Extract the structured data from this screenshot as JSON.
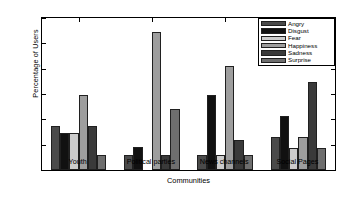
{
  "chart_data": {
    "type": "bar",
    "title": "",
    "xlabel": "Communities",
    "ylabel": "Percentage of Users",
    "categories": [
      "Youth",
      "Political parties",
      "News channels",
      "Social Pages"
    ],
    "ylim": [
      0,
      60
    ],
    "yticks": [
      0,
      10,
      20,
      30,
      40,
      50,
      60
    ],
    "grid": false,
    "legend_position": "upper right",
    "series": [
      {
        "name": "Angry",
        "color": "#4a4a4a",
        "values": [
          17.5,
          6.0,
          6.0,
          13.0
        ]
      },
      {
        "name": "Disgust",
        "color": "#111111",
        "values": [
          14.5,
          9.2,
          29.5,
          21.5
        ]
      },
      {
        "name": "Fear",
        "color": "#cccccc",
        "values": [
          14.5,
          0.0,
          6.0,
          8.6
        ]
      },
      {
        "name": "Happiness",
        "color": "#9e9e9e",
        "values": [
          29.5,
          54.5,
          41.2,
          13.0
        ]
      },
      {
        "name": "Sadness",
        "color": "#3a3a3a",
        "values": [
          17.5,
          6.0,
          12.0,
          34.6
        ]
      },
      {
        "name": "Surprise",
        "color": "#6e6e6e",
        "values": [
          6.0,
          24.0,
          6.0,
          8.6
        ]
      }
    ]
  }
}
